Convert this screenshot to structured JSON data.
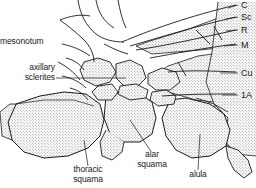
{
  "figure": {
    "kind": "anatomical-line-drawing",
    "background_color": "#ffffff",
    "ink_color": "#1a1a1a",
    "stipple_color": "#8e8e8e"
  },
  "labels": {
    "mesonotum": "mesonotum",
    "axillary_line1": "axillary",
    "axillary_line2": "sclerites",
    "thoracic_line1": "thoracic",
    "thoracic_line2": "squama",
    "alar_line1": "alar",
    "alar_line2": "squama",
    "alula": "alula"
  },
  "vein_labels": [
    {
      "id": "costa",
      "text": "C"
    },
    {
      "id": "subcosta",
      "text": "Sc"
    },
    {
      "id": "radius",
      "text": "R"
    },
    {
      "id": "media",
      "text": "M"
    },
    {
      "id": "cubitus",
      "text": "Cu"
    },
    {
      "id": "first-anal",
      "text": "1A"
    }
  ]
}
